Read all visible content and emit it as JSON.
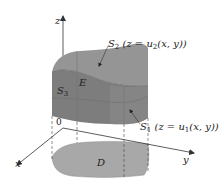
{
  "diagram": {
    "axes": {
      "x": "x",
      "y": "y",
      "z": "z",
      "origin": "0"
    },
    "labels": {
      "s2_name": "S",
      "s2_sub": "2",
      "s2_eq_pre": " (z = u",
      "s2_eq_sub": "2",
      "s2_eq_post": "(x, y))",
      "s1_name": "S",
      "s1_sub": "1",
      "s1_eq_pre": " (z = u",
      "s1_eq_sub": "1",
      "s1_eq_post": "(x, y))",
      "s3_name": "S",
      "s3_sub": "3",
      "region": "E",
      "domain": "D"
    },
    "colors": {
      "top_surface": "#8e8e8e",
      "front_face": "#7d7d7d",
      "side_face": "#9a9a9a",
      "domain": "#a8a8a8",
      "lines": "#333333",
      "dashes": "#444444"
    }
  }
}
